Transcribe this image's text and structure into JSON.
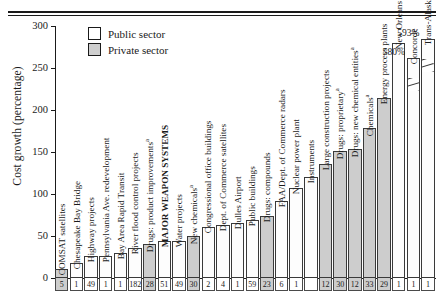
{
  "chart_data": {
    "type": "bar",
    "title": "",
    "xlabel": "",
    "ylabel": "Cost growth (percentage)",
    "ylim": [
      0,
      300
    ],
    "yticks": [
      0,
      50,
      100,
      150,
      200,
      250,
      300
    ],
    "grid": false,
    "legend_position": "top-left",
    "legend": [
      "Public sector",
      "Private sector"
    ],
    "categories": [
      "COMSAT satellites",
      "Chesapeake Bay Bridge",
      "Highway projects",
      "Pennsylvania Ave. redevelopment",
      "Bay Area Rapid Transit",
      "River flood control projects",
      "Drugs: product improvements",
      "MAJOR WEAPON SYSTEMS",
      "Water projects",
      "New chemicals",
      "Congressional office buildings",
      "Dept. of Commerce satellites",
      "Dulles Airport",
      "Public buildings",
      "Drugs: compounds",
      "FAA/Dept. of Commerce radars",
      "Nuclear power plant",
      "Instruments",
      "Large construction projects",
      "Drugs: proprietary",
      "Drugs: new chemical entities",
      "Chemicals",
      "Energy process plants",
      "New Orleans Superdome",
      "Concorde",
      "Trans-Alaska Pipeline"
    ],
    "values": [
      11,
      18,
      26,
      26,
      30,
      36,
      41,
      44,
      44,
      50,
      61,
      63,
      66,
      69,
      74,
      92,
      107,
      120,
      136,
      151,
      154,
      178,
      214,
      280,
      580,
      593
    ],
    "sectors": [
      "private",
      "public",
      "public",
      "public",
      "public",
      "public",
      "private",
      "public",
      "public",
      "private",
      "public",
      "public",
      "public",
      "public",
      "private",
      "public",
      "public",
      "public",
      "private",
      "private",
      "private",
      "private",
      "private",
      "public",
      "public",
      "public"
    ],
    "bold_categories": [
      "MAJOR WEAPON SYSTEMS"
    ],
    "footnote_marked": [
      "Drugs: product improvements",
      "New chemicals",
      "Drugs: proprietary",
      "Drugs: new chemical entities",
      "Chemicals"
    ],
    "sample_counts": [
      "5",
      "1",
      "49",
      "1",
      "1",
      "182",
      "28",
      "51",
      "49",
      "30",
      "2",
      "4",
      "1",
      "59",
      "23",
      "6",
      "1",
      "",
      "12",
      "30",
      "12",
      "33",
      "29",
      "1",
      "1",
      "1"
    ],
    "broken_bars": [
      {
        "category": "Concorde",
        "label": "580%"
      },
      {
        "category": "Trans-Alaska Pipeline",
        "label": "593%"
      }
    ]
  },
  "legend": {
    "public_label": "Public sector",
    "private_label": "Private sector"
  }
}
